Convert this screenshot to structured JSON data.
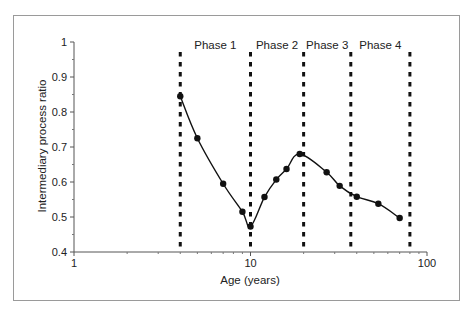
{
  "chart_data": {
    "type": "line",
    "title": "",
    "xlabel": "Age (years)",
    "ylabel": "Intermediary process ratio",
    "xscale": "log",
    "xlim": [
      1,
      100
    ],
    "ylim": [
      0.4,
      1.0
    ],
    "x_ticks": [
      1,
      10,
      100
    ],
    "x_tick_labels": [
      "1",
      "10",
      "100"
    ],
    "y_ticks": [
      0.4,
      0.5,
      0.6,
      0.7,
      0.8,
      0.9,
      1.0
    ],
    "y_tick_labels": [
      "0.4",
      "0.5",
      "0.6",
      "0.7",
      "0.8",
      "0.9",
      "1"
    ],
    "grid": false,
    "legend": null,
    "series": [
      {
        "name": "Intermediary process ratio",
        "marker": "circle",
        "smooth": true,
        "color": "#111111",
        "x": [
          4,
          5,
          7,
          9,
          10,
          12,
          14,
          16,
          19,
          27,
          32,
          40,
          53,
          70
        ],
        "y": [
          0.845,
          0.725,
          0.595,
          0.515,
          0.473,
          0.557,
          0.607,
          0.637,
          0.68,
          0.628,
          0.589,
          0.558,
          0.538,
          0.497
        ]
      }
    ],
    "phase_boundaries": [
      4,
      10,
      20,
      37,
      80
    ],
    "phases": [
      {
        "label": "Phase 1",
        "from": 4,
        "to": 10
      },
      {
        "label": "Phase 2",
        "from": 10,
        "to": 20
      },
      {
        "label": "Phase 3",
        "from": 20,
        "to": 37
      },
      {
        "label": "Phase 4",
        "from": 37,
        "to": 80
      }
    ]
  }
}
